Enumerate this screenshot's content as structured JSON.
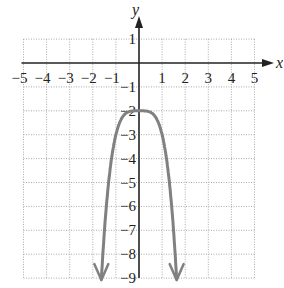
{
  "chart_data": {
    "type": "line",
    "title": "",
    "xlabel": "x",
    "ylabel": "y",
    "xlim": [
      -5,
      5
    ],
    "ylim": [
      -9,
      1
    ],
    "grid": true,
    "x_ticks": [
      "-5",
      "-4",
      "-3",
      "-2",
      "-1",
      "1",
      "2",
      "3",
      "4",
      "5"
    ],
    "y_ticks": [
      "1",
      "-1",
      "-2",
      "-3",
      "-4",
      "-5",
      "-6",
      "-7",
      "-8",
      "-9"
    ],
    "series": [
      {
        "name": "y = -x^4 - 2",
        "color": "#808080",
        "x": [
          -1.62,
          -1.5,
          -1.3,
          -1.1,
          -1.0,
          -0.8,
          -0.6,
          -0.3,
          0,
          0.3,
          0.6,
          0.8,
          1.0,
          1.1,
          1.3,
          1.5,
          1.62
        ],
        "y": [
          -8.9,
          -7.06,
          -4.86,
          -3.46,
          -3.0,
          -2.41,
          -2.13,
          -2.01,
          -2.0,
          -2.01,
          -2.13,
          -2.41,
          -3.0,
          -3.46,
          -4.86,
          -7.06,
          -8.9
        ],
        "arrows": "both-ends-down"
      }
    ]
  }
}
